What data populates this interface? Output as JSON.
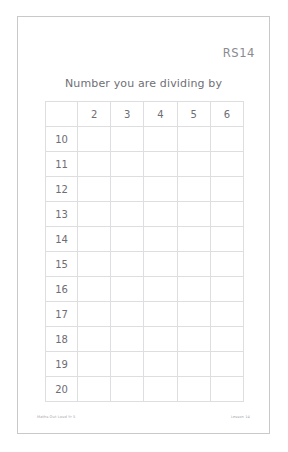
{
  "page": {
    "sheet_code": "RS14",
    "title": "Number you are dividing by",
    "footer_left": "Maths Out Loud Yr 5",
    "footer_right": "Lesson 14",
    "border_color": "#c9c9cc",
    "grid_line_color": "#dedee1",
    "text_color": "#6d6d74"
  },
  "grid": {
    "corner_label": "",
    "column_headers": [
      "2",
      "3",
      "4",
      "5",
      "6"
    ],
    "row_labels": [
      "10",
      "11",
      "12",
      "13",
      "14",
      "15",
      "16",
      "17",
      "18",
      "19",
      "20"
    ],
    "cells": [
      [
        "",
        "",
        "",
        "",
        ""
      ],
      [
        "",
        "",
        "",
        "",
        ""
      ],
      [
        "",
        "",
        "",
        "",
        ""
      ],
      [
        "",
        "",
        "",
        "",
        ""
      ],
      [
        "",
        "",
        "",
        "",
        ""
      ],
      [
        "",
        "",
        "",
        "",
        ""
      ],
      [
        "",
        "",
        "",
        "",
        ""
      ],
      [
        "",
        "",
        "",
        "",
        ""
      ],
      [
        "",
        "",
        "",
        "",
        ""
      ],
      [
        "",
        "",
        "",
        "",
        ""
      ],
      [
        "",
        "",
        "",
        "",
        ""
      ]
    ]
  }
}
